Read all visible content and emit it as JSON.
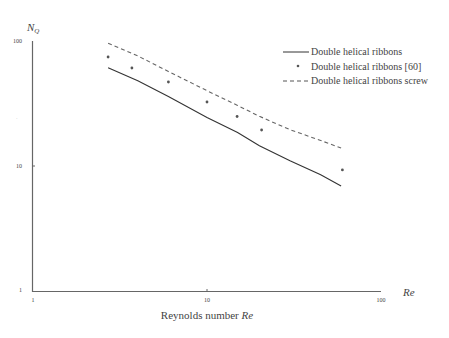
{
  "chart_data": {
    "type": "line",
    "title": "",
    "xlabel": "Reynolds number Re",
    "xlabel_plain": "Reynolds number ",
    "xlabel_var": "Re",
    "x_axis_end_label": "Re",
    "ylabel": "N_Q",
    "ylabel_main": "N",
    "ylabel_sub": "Q",
    "xscale": "log",
    "yscale": "log",
    "xlim": [
      1,
      100
    ],
    "ylim": [
      1,
      100
    ],
    "x_ticks": [
      "1",
      "10",
      "100"
    ],
    "y_ticks": [
      "1",
      "10",
      "100"
    ],
    "grid": false,
    "legend_position": "upper right",
    "series": [
      {
        "name": "Double helical ribbons",
        "style": "solid",
        "x": [
          2.7,
          4,
          6,
          10,
          15,
          20,
          30,
          45,
          59
        ],
        "y": [
          61,
          48,
          36,
          24.5,
          18.5,
          14.5,
          11,
          8.5,
          6.9
        ]
      },
      {
        "name": "Double helical ribbons [60]",
        "style": "points",
        "x": [
          2.7,
          3.7,
          6.0,
          10,
          14.9,
          20.6,
          60
        ],
        "y": [
          74.5,
          60.8,
          47,
          32.5,
          24.9,
          19.4,
          9.3
        ]
      },
      {
        "name": "Double helical ribbons screw",
        "style": "dashed",
        "x": [
          2.7,
          4,
          6,
          10,
          15,
          20,
          30,
          45,
          59
        ],
        "y": [
          96,
          76,
          57,
          40,
          30.5,
          25,
          19.5,
          16,
          13.9
        ]
      }
    ]
  },
  "legend": {
    "items": [
      {
        "label": "Double helical ribbons"
      },
      {
        "label": "Double helical ribbons [60]"
      },
      {
        "label": "Double helical ribbons screw"
      }
    ]
  }
}
